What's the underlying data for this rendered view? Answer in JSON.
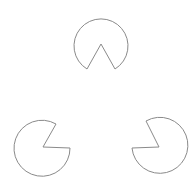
{
  "figure": {
    "type": "kanizsa-triangle-illusion",
    "background": "#ffffff",
    "stroke": "#8a8a8a",
    "shapes": [
      {
        "name": "top",
        "path": "M 101 44 L 87 69 A 27 27 0 1 1 115 69 Z"
      },
      {
        "name": "bottom-left",
        "path": "M 43 147 L 56 124 A 28 28 0 1 0 70 148 Z"
      },
      {
        "name": "bottom-right",
        "path": "M 159 147 L 132 148 A 28 28 0 1 0 146 121 Z"
      }
    ]
  }
}
